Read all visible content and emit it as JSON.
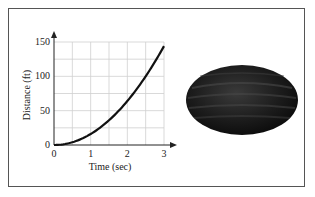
{
  "chart_data": {
    "type": "line",
    "title": "",
    "xlabel": "Time (sec)",
    "ylabel": "Distance (ft)",
    "xlim": [
      0,
      3
    ],
    "ylim": [
      0,
      150
    ],
    "x_ticks": [
      "0",
      "1",
      "2",
      "3"
    ],
    "y_ticks": [
      "0",
      "50",
      "100",
      "150"
    ],
    "grid": true,
    "grid_x_step": 0.5,
    "grid_y_step": 25,
    "legend": null,
    "series": [
      {
        "name": "Distance",
        "function": "d = 16t^2",
        "x": [
          0,
          0.5,
          1,
          1.5,
          2,
          2.5,
          3
        ],
        "values": [
          0,
          4,
          16,
          36,
          64,
          100,
          144
        ]
      }
    ]
  },
  "image": {
    "description": "watermelon",
    "color": "#1a1a1a"
  }
}
